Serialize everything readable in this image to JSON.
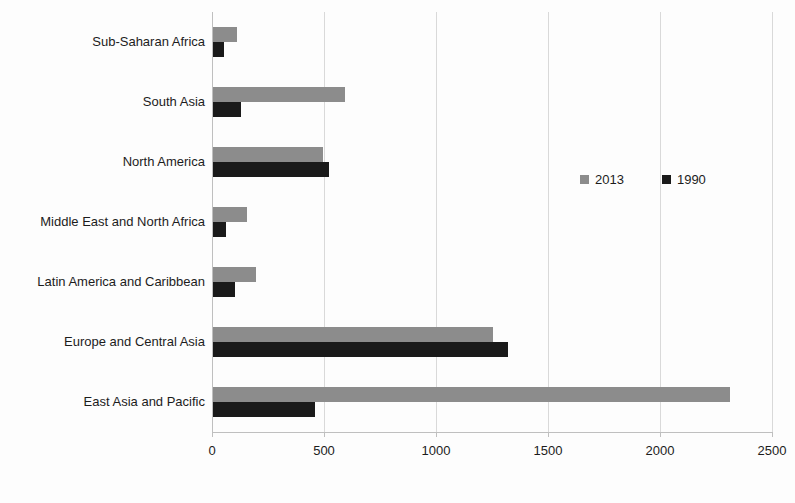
{
  "chart_data": {
    "type": "bar",
    "orientation": "horizontal",
    "title": "",
    "subtitle": "",
    "xlabel": "",
    "ylabel": "",
    "xlim": [
      0,
      2500
    ],
    "ylim": null,
    "grid": "vertical",
    "legend_position": "middle-right",
    "x_ticks": [
      "0",
      "500",
      "1000",
      "1500",
      "2000",
      "2500"
    ],
    "x_tick_values": [
      0,
      500,
      1000,
      1500,
      2000,
      2500
    ],
    "categories": [
      "Sub-Saharan Africa",
      "South Asia",
      "North America",
      "Middle East and North Africa",
      "Latin America and Caribbean",
      "Europe and Central Asia",
      "East Asia and Pacific"
    ],
    "series": [
      {
        "name": "2013",
        "color": "#8c8c8c",
        "values": [
          105,
          590,
          490,
          150,
          190,
          1250,
          2310
        ]
      },
      {
        "name": "1990",
        "color": "#1a1a1a",
        "values": [
          50,
          125,
          520,
          60,
          100,
          1315,
          455
        ]
      }
    ]
  },
  "legend": {
    "items": [
      {
        "label": "2013",
        "color": "#8c8c8c"
      },
      {
        "label": "1990",
        "color": "#1a1a1a"
      }
    ]
  },
  "colors": {
    "series_2013": "#8c8c8c",
    "series_1990": "#1a1a1a",
    "gridline": "#d9d9d9",
    "axis": "#bfbfbf",
    "text": "#1c1c1c",
    "background": "#fdfdfd"
  }
}
